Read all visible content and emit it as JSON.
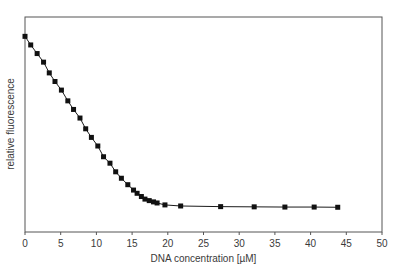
{
  "chart_data": {
    "type": "line",
    "title": "",
    "xlabel": "DNA concentration [µM]",
    "ylabel": "relative fluorescence",
    "xlim": [
      0,
      50
    ],
    "ylim": [
      0,
      1
    ],
    "xticks": [
      0,
      5,
      10,
      15,
      20,
      25,
      30,
      35,
      40,
      45,
      50
    ],
    "yticks": [],
    "grid": false,
    "legend": false,
    "marker": "filled-square",
    "colors": {
      "line": "#1a1a1a",
      "marker": "#111111",
      "axis": "#555555",
      "text": "#3a3a3a",
      "background": "#ffffff"
    },
    "series": [
      {
        "name": "relative fluorescence",
        "x": [
          0,
          0.8,
          1.7,
          2.6,
          3.4,
          4.2,
          5.1,
          6.0,
          6.8,
          7.7,
          8.5,
          9.3,
          10.2,
          11.0,
          11.9,
          12.7,
          13.5,
          14.4,
          15.2,
          15.7,
          16.3,
          16.8,
          17.4,
          18.0,
          18.5,
          19.6,
          21.8,
          27.4,
          32.1,
          36.4,
          40.5,
          43.8
        ],
        "y": [
          0.91,
          0.87,
          0.83,
          0.79,
          0.74,
          0.7,
          0.66,
          0.61,
          0.57,
          0.53,
          0.48,
          0.44,
          0.4,
          0.35,
          0.32,
          0.28,
          0.25,
          0.22,
          0.195,
          0.18,
          0.165,
          0.153,
          0.146,
          0.14,
          0.135,
          0.126,
          0.121,
          0.118,
          0.117,
          0.116,
          0.116,
          0.115
        ]
      }
    ]
  }
}
